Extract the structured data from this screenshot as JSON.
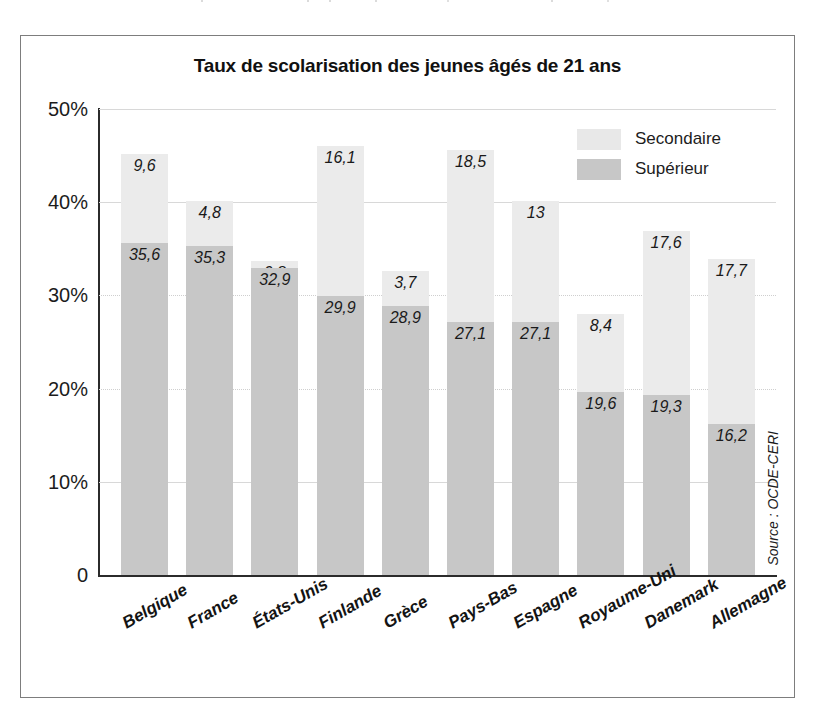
{
  "figure": {
    "title": "Taux de scolarisation des jeunes âgés de 21 ans",
    "source_note": "Source : OCDE-CERI"
  },
  "legend": {
    "items": [
      {
        "label": "Secondaire",
        "color": "#e8e8e8"
      },
      {
        "label": "Supérieur",
        "color": "#c7c7c7"
      }
    ]
  },
  "axis": {
    "y_ticks": [
      "50%",
      "40%",
      "30%",
      "20%",
      "10%",
      "0"
    ]
  },
  "chart_data": {
    "type": "bar",
    "stacked": true,
    "title": "Taux de scolarisation des jeunes âgés de 21 ans",
    "subtitle": "",
    "xlabel": "",
    "ylabel": "",
    "ylim": [
      0,
      50
    ],
    "ytick_values": [
      0,
      10,
      20,
      30,
      40,
      50
    ],
    "ytick_labels": [
      "0",
      "10%",
      "20%",
      "30%",
      "40%",
      "50%"
    ],
    "grid": "horizontal",
    "legend_position": "top-right",
    "categories": [
      "Belgique",
      "France",
      "États-Unis",
      "Finlande",
      "Grèce",
      "Pays-Bas",
      "Espagne",
      "Royaume-Uni",
      "Danemark",
      "Allemagne"
    ],
    "series": [
      {
        "name": "Supérieur",
        "color": "#c7c7c7",
        "values": [
          35.6,
          35.3,
          32.9,
          29.9,
          28.9,
          27.1,
          27.1,
          19.6,
          19.3,
          16.2
        ],
        "labels": [
          "35,6",
          "35,3",
          "32,9",
          "29,9",
          "28,9",
          "27,1",
          "27,1",
          "19,6",
          "19,3",
          "16,2"
        ]
      },
      {
        "name": "Secondaire",
        "color": "#ebebeb",
        "values": [
          9.6,
          4.8,
          0.8,
          16.1,
          3.7,
          18.5,
          13.0,
          8.4,
          17.6,
          17.7
        ],
        "labels": [
          "9,6",
          "4,8",
          "0,8",
          "16,1",
          "3,7",
          "18,5",
          "13",
          "8,4",
          "17,6",
          "17,7"
        ]
      }
    ],
    "totals": [
      45.2,
      40.1,
      33.7,
      46.0,
      32.6,
      45.6,
      40.1,
      28.0,
      36.9,
      33.9
    ]
  }
}
